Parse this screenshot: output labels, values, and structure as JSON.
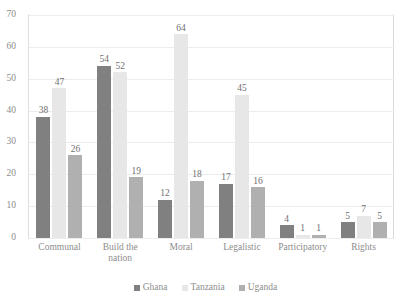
{
  "chart_data": {
    "type": "bar",
    "title": "",
    "subtitle": "",
    "xlabel": "",
    "ylabel": "",
    "ylim": [
      0,
      70
    ],
    "ytick_step": 10,
    "yticks": [
      0,
      10,
      20,
      30,
      40,
      50,
      60,
      70
    ],
    "grid": true,
    "grid_axis": "y",
    "legend_position": "bottom-center",
    "data_labels": true,
    "categories": [
      "Communal",
      "Build the nation",
      "Moral",
      "Legalistic",
      "Participatory",
      "Rights"
    ],
    "series": [
      {
        "name": "Ghana",
        "color": "#808080",
        "values": [
          38,
          54,
          12,
          17,
          4,
          5
        ]
      },
      {
        "name": "Tanzania",
        "color": "#e7e7e7",
        "values": [
          47,
          52,
          64,
          45,
          1,
          7
        ]
      },
      {
        "name": "Uganda",
        "color": "#b0b0b0",
        "values": [
          26,
          19,
          18,
          16,
          1,
          5
        ]
      }
    ]
  },
  "style": {
    "background": "#ffffff",
    "text_color": "#8d8d8d",
    "label_color": "#6f6f6f",
    "grid_color": "#ededed",
    "axis_color": "#d9d9d9"
  }
}
